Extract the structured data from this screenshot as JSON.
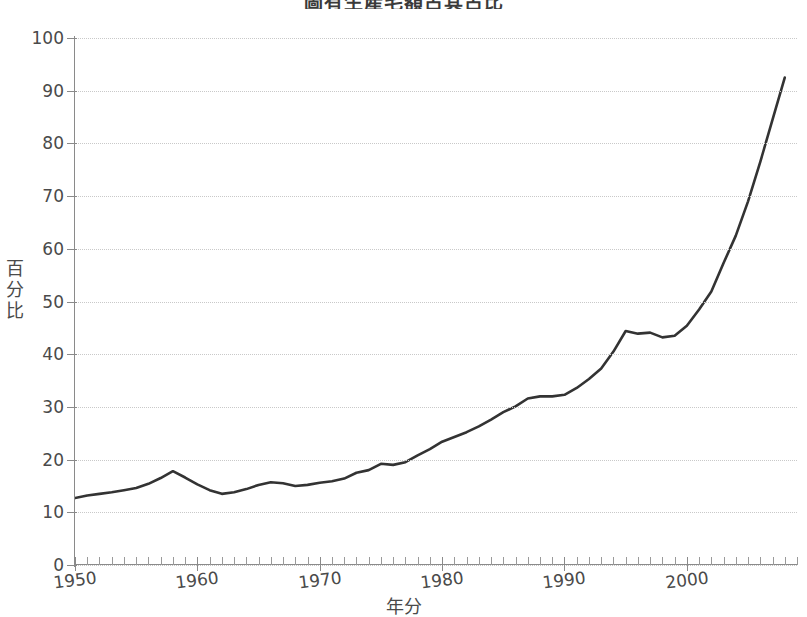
{
  "chart_data": {
    "type": "line",
    "title": "圖有生產毛額占其占比",
    "xlabel": "年分",
    "ylabel": "百分比",
    "ylim": [
      0,
      100
    ],
    "xlim": [
      1950,
      2009
    ],
    "ytick_labels": [
      "0",
      "10",
      "20",
      "30",
      "40",
      "50",
      "60",
      "70",
      "80",
      "90",
      "100"
    ],
    "ytick_values": [
      0,
      10,
      20,
      30,
      40,
      50,
      60,
      70,
      80,
      90,
      100
    ],
    "xtick_labels": [
      "1950",
      "1960",
      "1970",
      "1980",
      "1990",
      "2000"
    ],
    "xtick_values": [
      1950,
      1960,
      1970,
      1980,
      1990,
      2000
    ],
    "grid": "horizontal-dotted",
    "legend": "none",
    "line_color": "#333333",
    "grid_color": "#c9c9c9",
    "axis_color": "#8a8a8a",
    "background": "#ffffff",
    "x": [
      1950,
      1951,
      1952,
      1953,
      1954,
      1955,
      1956,
      1957,
      1958,
      1959,
      1960,
      1961,
      1962,
      1963,
      1964,
      1965,
      1966,
      1967,
      1968,
      1969,
      1970,
      1971,
      1972,
      1973,
      1974,
      1975,
      1976,
      1977,
      1978,
      1979,
      1980,
      1981,
      1982,
      1983,
      1984,
      1985,
      1986,
      1987,
      1988,
      1989,
      1990,
      1991,
      1992,
      1993,
      1994,
      1995,
      1996,
      1997,
      1998,
      1999,
      2000,
      2001,
      2002,
      2003,
      2004,
      2005,
      2006,
      2007,
      2008
    ],
    "values": [
      12.7,
      13.2,
      13.5,
      13.8,
      14.2,
      14.6,
      15.4,
      16.5,
      17.8,
      16.6,
      15.3,
      14.2,
      13.5,
      13.8,
      14.4,
      15.2,
      15.7,
      15.5,
      15.0,
      15.2,
      15.6,
      15.9,
      16.4,
      17.5,
      18.0,
      19.2,
      19.0,
      19.5,
      20.8,
      22.0,
      23.4,
      24.3,
      25.2,
      26.3,
      27.6,
      29.0,
      30.1,
      31.6,
      32.0,
      32.0,
      32.3,
      33.6,
      35.3,
      37.3,
      40.5,
      44.4,
      43.9,
      44.1,
      43.2,
      43.5,
      45.4,
      48.5,
      51.9,
      57.3,
      62.5,
      69.0,
      76.5,
      84.5,
      92.5
    ],
    "series_name": "percentage"
  }
}
